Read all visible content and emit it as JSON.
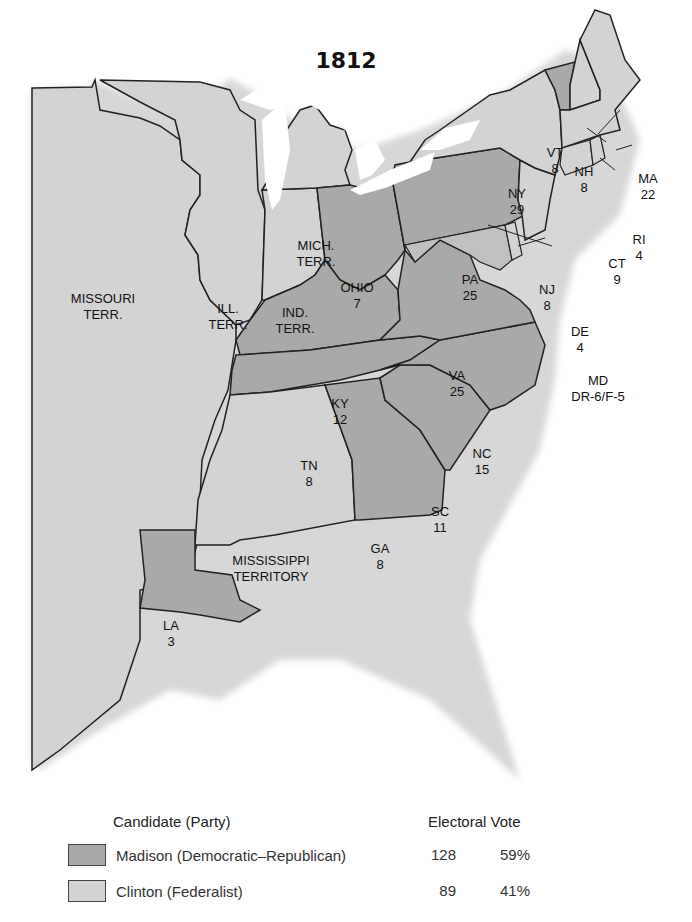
{
  "title": "1812",
  "colors": {
    "madison": "#a9a9a9",
    "clinton": "#d3d3d3",
    "border": "#222222",
    "water": "#ffffff"
  },
  "regions": [
    {
      "name": "MISSOURI",
      "line2": "TERR.",
      "party": "clinton"
    },
    {
      "name": "ILL.",
      "line2": "TERR.",
      "party": "clinton"
    },
    {
      "name": "IND.",
      "line2": "TERR.",
      "party": "clinton"
    },
    {
      "name": "MICH.",
      "line2": "TERR.",
      "party": "clinton"
    },
    {
      "name": "OHIO",
      "line2": "7",
      "party": "madison"
    },
    {
      "name": "KY",
      "line2": "12",
      "party": "madison"
    },
    {
      "name": "TN",
      "line2": "8",
      "party": "madison"
    },
    {
      "name": "MISSISSIPPI",
      "line2": "TERRITORY",
      "party": "clinton"
    },
    {
      "name": "LA",
      "line2": "3",
      "party": "madison"
    },
    {
      "name": "GA",
      "line2": "8",
      "party": "madison"
    },
    {
      "name": "SC",
      "line2": "11",
      "party": "madison"
    },
    {
      "name": "NC",
      "line2": "15",
      "party": "madison"
    },
    {
      "name": "VA",
      "line2": "25",
      "party": "madison"
    },
    {
      "name": "PA",
      "line2": "25",
      "party": "madison"
    },
    {
      "name": "NY",
      "line2": "29",
      "party": "clinton"
    },
    {
      "name": "VT",
      "line2": "8",
      "party": "madison"
    },
    {
      "name": "NH",
      "line2": "8",
      "party": "clinton"
    },
    {
      "name": "MA",
      "line2": "22",
      "party": "clinton"
    },
    {
      "name": "RI",
      "line2": "4",
      "party": "clinton"
    },
    {
      "name": "CT",
      "line2": "9",
      "party": "clinton"
    },
    {
      "name": "NJ",
      "line2": "8",
      "party": "clinton"
    },
    {
      "name": "DE",
      "line2": "4",
      "party": "clinton"
    },
    {
      "name": "MD",
      "line2": "DR-6/F-5",
      "party": "split"
    }
  ],
  "legend": {
    "candidate_header": "Candidate (Party)",
    "vote_header": "Electoral Vote",
    "rows": [
      {
        "label": "Madison (Democratic–Republican)",
        "votes": "128",
        "percent": "59%"
      },
      {
        "label": "Clinton (Federalist)",
        "votes": "89",
        "percent": "41%"
      }
    ]
  }
}
